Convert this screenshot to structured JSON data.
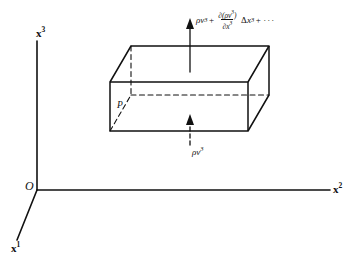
{
  "figure": {
    "background_color": "#ffffff",
    "ink_color": "#111111"
  },
  "axes": {
    "origin_label": "O",
    "vertical": {
      "name": "x3",
      "base": "x",
      "exponent": "3"
    },
    "horizontal": {
      "name": "x2",
      "base": "x",
      "exponent": "2"
    },
    "depth": {
      "name": "x1",
      "base": "x",
      "exponent": "1"
    }
  },
  "box": {
    "point_label": "P",
    "solid_edges": "visible outline of rectangular control volume",
    "dashed_edges": "hidden back edges of rectangular control volume"
  },
  "flux_in": {
    "arrow_style": "dashed",
    "arrow_direction": "up",
    "label": {
      "rho": "ρ",
      "nu": "ν",
      "exponent": "3",
      "plain": "ρν³"
    }
  },
  "flux_out": {
    "arrow_style": "solid",
    "arrow_direction": "up",
    "label": {
      "lead_rho": "ρ",
      "lead_nu": "ν",
      "lead_exponent": "3",
      "plus": "+",
      "numerator_partial": "∂",
      "numerator_open": "(",
      "numerator_rho": "ρ",
      "numerator_nu": "ν",
      "numerator_exponent": "3",
      "numerator_close": ")",
      "denominator_partial": "∂",
      "denominator_base": "x",
      "denominator_exponent": "3",
      "delta": "Δ",
      "delta_base": "x",
      "delta_exponent": "3",
      "trailing_plus": "+",
      "ellipsis": "···",
      "plain": "ρν³ + ∂(ρν³)/∂x³ Δx³ + ···"
    }
  }
}
